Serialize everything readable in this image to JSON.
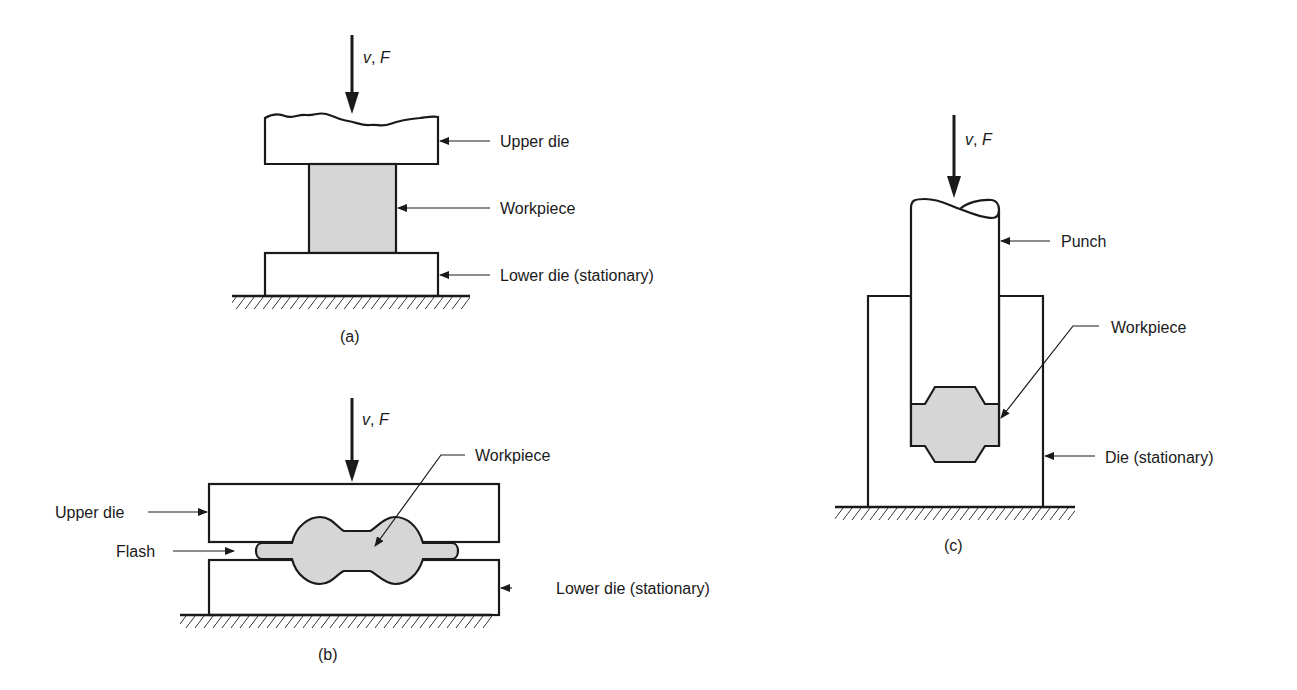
{
  "figure": {
    "colors": {
      "line": "#1a1a1a",
      "workpiece_fill": "#d6d6d6",
      "background": "#ffffff"
    },
    "panels": [
      {
        "id": "a",
        "caption": "(a)",
        "force_label_v": "v",
        "force_label_sep": ", ",
        "force_label_F": "F",
        "labels": {
          "upper_die": "Upper die",
          "workpiece": "Workpiece",
          "lower_die": "Lower die (stationary)"
        }
      },
      {
        "id": "b",
        "caption": "(b)",
        "force_label_v": "v",
        "force_label_sep": ", ",
        "force_label_F": "F",
        "labels": {
          "upper_die": "Upper die",
          "flash": "Flash",
          "workpiece": "Workpiece",
          "lower_die": "Lower die (stationary)"
        }
      },
      {
        "id": "c",
        "caption": "(c)",
        "force_label_v": "v",
        "force_label_sep": ", ",
        "force_label_F": "F",
        "labels": {
          "punch": "Punch",
          "workpiece": "Workpiece",
          "die": "Die (stationary)"
        }
      }
    ]
  }
}
